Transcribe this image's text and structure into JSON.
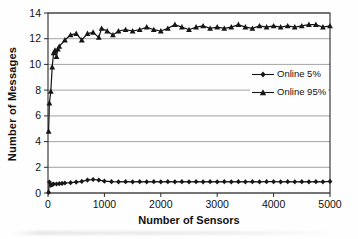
{
  "chart_data": {
    "type": "line",
    "title": "",
    "xlabel": "Number of Sensors",
    "ylabel": "Number of Messages",
    "xlim": [
      0,
      5000
    ],
    "ylim": [
      0,
      14
    ],
    "x_ticks": [
      0,
      1000,
      2000,
      3000,
      4000,
      5000
    ],
    "y_ticks": [
      0,
      2,
      4,
      6,
      8,
      10,
      12,
      14
    ],
    "grid": "horizontal",
    "legend_position": "inside-right",
    "colors": {
      "series": "#161616",
      "grid": "#8c8c8c",
      "axis": "#2b2b2b",
      "text": "#111111",
      "background": "#fefefe"
    },
    "series": [
      {
        "name": "Online 5%",
        "marker": "diamond",
        "points": [
          [
            10,
            0.05
          ],
          [
            25,
            0.85
          ],
          [
            50,
            0.6
          ],
          [
            75,
            0.65
          ],
          [
            100,
            0.7
          ],
          [
            150,
            0.7
          ],
          [
            200,
            0.72
          ],
          [
            250,
            0.75
          ],
          [
            300,
            0.78
          ],
          [
            400,
            0.8
          ],
          [
            500,
            0.85
          ],
          [
            600,
            0.9
          ],
          [
            700,
            1.0
          ],
          [
            800,
            1.05
          ],
          [
            900,
            1.0
          ],
          [
            1000,
            0.92
          ],
          [
            1125,
            0.88
          ],
          [
            1250,
            0.87
          ],
          [
            1375,
            0.88
          ],
          [
            1500,
            0.87
          ],
          [
            1625,
            0.88
          ],
          [
            1750,
            0.87
          ],
          [
            1875,
            0.88
          ],
          [
            2000,
            0.87
          ],
          [
            2125,
            0.88
          ],
          [
            2250,
            0.87
          ],
          [
            2375,
            0.88
          ],
          [
            2500,
            0.87
          ],
          [
            2625,
            0.88
          ],
          [
            2750,
            0.87
          ],
          [
            2875,
            0.88
          ],
          [
            3000,
            0.87
          ],
          [
            3125,
            0.88
          ],
          [
            3250,
            0.87
          ],
          [
            3375,
            0.88
          ],
          [
            3500,
            0.87
          ],
          [
            3625,
            0.88
          ],
          [
            3750,
            0.87
          ],
          [
            3875,
            0.88
          ],
          [
            4000,
            0.88
          ],
          [
            4125,
            0.87
          ],
          [
            4250,
            0.88
          ],
          [
            4375,
            0.87
          ],
          [
            4500,
            0.88
          ],
          [
            4625,
            0.87
          ],
          [
            4750,
            0.88
          ],
          [
            4875,
            0.87
          ],
          [
            5000,
            0.9
          ]
        ]
      },
      {
        "name": "Online 95%",
        "marker": "triangle",
        "points": [
          [
            10,
            4.8
          ],
          [
            25,
            7.0
          ],
          [
            50,
            7.9
          ],
          [
            75,
            9.8
          ],
          [
            100,
            10.9
          ],
          [
            125,
            11.1
          ],
          [
            150,
            10.6
          ],
          [
            175,
            11.2
          ],
          [
            200,
            11.4
          ],
          [
            300,
            11.9
          ],
          [
            400,
            12.3
          ],
          [
            500,
            12.4
          ],
          [
            600,
            11.9
          ],
          [
            700,
            12.4
          ],
          [
            800,
            12.5
          ],
          [
            900,
            12.1
          ],
          [
            950,
            12.8
          ],
          [
            1050,
            12.6
          ],
          [
            1150,
            12.3
          ],
          [
            1250,
            12.6
          ],
          [
            1375,
            12.7
          ],
          [
            1500,
            12.6
          ],
          [
            1625,
            12.7
          ],
          [
            1750,
            12.9
          ],
          [
            1875,
            12.7
          ],
          [
            2000,
            12.6
          ],
          [
            2125,
            12.8
          ],
          [
            2250,
            13.1
          ],
          [
            2375,
            12.9
          ],
          [
            2500,
            12.7
          ],
          [
            2625,
            12.9
          ],
          [
            2750,
            13.0
          ],
          [
            2875,
            12.8
          ],
          [
            3000,
            12.9
          ],
          [
            3125,
            12.8
          ],
          [
            3250,
            12.9
          ],
          [
            3375,
            13.1
          ],
          [
            3500,
            12.9
          ],
          [
            3625,
            12.8
          ],
          [
            3750,
            13.0
          ],
          [
            3875,
            12.9
          ],
          [
            4000,
            13.0
          ],
          [
            4125,
            12.9
          ],
          [
            4250,
            13.0
          ],
          [
            4375,
            12.9
          ],
          [
            4500,
            13.0
          ],
          [
            4625,
            13.1
          ],
          [
            4750,
            13.1
          ],
          [
            4875,
            12.9
          ],
          [
            5000,
            13.0
          ]
        ]
      }
    ]
  }
}
